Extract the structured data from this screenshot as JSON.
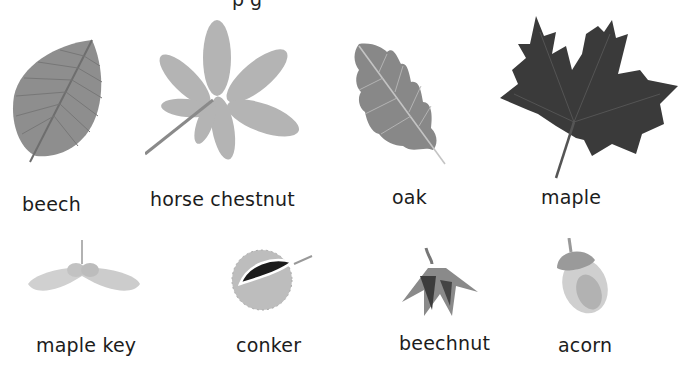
{
  "title_fragment": "p g",
  "colors": {
    "light_leaf": "#b8b8b8",
    "mid_leaf": "#8c8c8c",
    "dark_leaf": "#3a3a3a",
    "vein": "#c8c8c8",
    "text": "#1c1c1c"
  },
  "leaves": [
    {
      "name": "beech",
      "label": "beech"
    },
    {
      "name": "horse-chestnut",
      "label": "horse chestnut"
    },
    {
      "name": "oak",
      "label": "oak"
    },
    {
      "name": "maple",
      "label": "maple"
    }
  ],
  "seeds": [
    {
      "name": "maple-key",
      "label": "maple key"
    },
    {
      "name": "conker",
      "label": "conker"
    },
    {
      "name": "beechnut",
      "label": "beechnut"
    },
    {
      "name": "acorn",
      "label": "acorn"
    }
  ]
}
